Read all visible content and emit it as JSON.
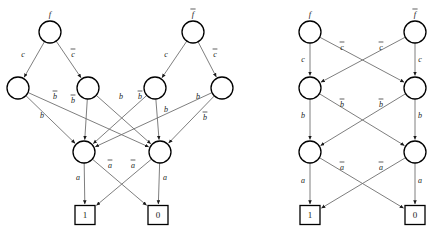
{
  "figure": {
    "title": "",
    "width": 431,
    "height": 231,
    "background_color": "#ffffff",
    "edge_color": "#6f6f6f",
    "node_stroke_color": "#000000",
    "text_color": "#1a1a1a"
  },
  "diagrams": [
    {
      "id": "left-diagram",
      "name": "unreduced-bdd",
      "nodes": [
        {
          "id": "L_f",
          "label": "f",
          "overbar": false,
          "x": 50,
          "y": 32,
          "r": 11,
          "shape": "circle"
        },
        {
          "id": "L_fb",
          "label": "f",
          "overbar": true,
          "x": 193,
          "y": 32,
          "r": 11,
          "shape": "circle"
        },
        {
          "id": "L_c1",
          "label": "",
          "overbar": false,
          "x": 18,
          "y": 88,
          "r": 11,
          "shape": "circle"
        },
        {
          "id": "L_c2",
          "label": "",
          "overbar": false,
          "x": 88,
          "y": 88,
          "r": 11,
          "shape": "circle"
        },
        {
          "id": "L_c3",
          "label": "",
          "overbar": false,
          "x": 155,
          "y": 88,
          "r": 11,
          "shape": "circle"
        },
        {
          "id": "L_c4",
          "label": "",
          "overbar": false,
          "x": 222,
          "y": 88,
          "r": 11,
          "shape": "circle"
        },
        {
          "id": "L_b1",
          "label": "",
          "overbar": false,
          "x": 84,
          "y": 152,
          "r": 11,
          "shape": "circle"
        },
        {
          "id": "L_b2",
          "label": "",
          "overbar": false,
          "x": 160,
          "y": 152,
          "r": 11,
          "shape": "circle"
        },
        {
          "id": "L_t1",
          "label": "1",
          "overbar": false,
          "x": 85,
          "y": 215,
          "w": 20,
          "h": 19,
          "shape": "box"
        },
        {
          "id": "L_t0",
          "label": "0",
          "overbar": false,
          "x": 158,
          "y": 215,
          "w": 20,
          "h": 19,
          "shape": "box"
        }
      ],
      "edges": [
        {
          "from": "L_f",
          "to": "L_c1",
          "label": "c",
          "overbar": false,
          "lx": 23,
          "ly": 57
        },
        {
          "from": "L_f",
          "to": "L_c2",
          "label": "c",
          "overbar": true,
          "lx": 73,
          "ly": 57
        },
        {
          "from": "L_fb",
          "to": "L_c3",
          "label": "c",
          "overbar": false,
          "lx": 166,
          "ly": 57
        },
        {
          "from": "L_fb",
          "to": "L_c4",
          "label": "c",
          "overbar": true,
          "lx": 215,
          "ly": 57
        },
        {
          "from": "L_c1",
          "to": "L_b2",
          "label": "b",
          "overbar": true,
          "lx": 55,
          "ly": 99
        },
        {
          "from": "L_c1",
          "to": "L_b1",
          "label": "b",
          "overbar": false,
          "lx": 42,
          "ly": 118
        },
        {
          "from": "L_c2",
          "to": "L_b1",
          "label": "b",
          "overbar": true,
          "lx": 73,
          "ly": 103
        },
        {
          "from": "L_c2",
          "to": "L_b2",
          "label": "b",
          "overbar": false,
          "lx": 121,
          "ly": 99
        },
        {
          "from": "L_c3",
          "to": "L_b1",
          "label": "b",
          "overbar": true,
          "lx": 140,
          "ly": 99
        },
        {
          "from": "L_c3",
          "to": "L_b2",
          "label": "b",
          "overbar": false,
          "lx": 166,
          "ly": 112
        },
        {
          "from": "L_c4",
          "to": "L_b2",
          "label": "b",
          "overbar": false,
          "lx": 198,
          "ly": 99
        },
        {
          "from": "L_c4",
          "to": "L_b1",
          "label": "b",
          "overbar": true,
          "lx": 205,
          "ly": 120
        },
        {
          "from": "L_b1",
          "to": "L_t1",
          "label": "a",
          "overbar": false,
          "lx": 78,
          "ly": 180
        },
        {
          "from": "L_b1",
          "to": "L_t0",
          "label": "a",
          "overbar": true,
          "lx": 110,
          "ly": 168
        },
        {
          "from": "L_b2",
          "to": "L_t1",
          "label": "a",
          "overbar": true,
          "lx": 133,
          "ly": 168
        },
        {
          "from": "L_b2",
          "to": "L_t0",
          "label": "a",
          "overbar": false,
          "lx": 165,
          "ly": 180
        }
      ]
    },
    {
      "id": "right-diagram",
      "name": "reduced-bdd",
      "nodes": [
        {
          "id": "R_f",
          "label": "f",
          "overbar": false,
          "x": 310,
          "y": 32,
          "r": 11,
          "shape": "circle"
        },
        {
          "id": "R_fb",
          "label": "f",
          "overbar": true,
          "x": 415,
          "y": 32,
          "r": 11,
          "shape": "circle"
        },
        {
          "id": "R_c1",
          "label": "",
          "overbar": false,
          "x": 310,
          "y": 88,
          "r": 11,
          "shape": "circle"
        },
        {
          "id": "R_c2",
          "label": "",
          "overbar": false,
          "x": 415,
          "y": 88,
          "r": 11,
          "shape": "circle"
        },
        {
          "id": "R_b1",
          "label": "",
          "overbar": false,
          "x": 310,
          "y": 152,
          "r": 11,
          "shape": "circle"
        },
        {
          "id": "R_b2",
          "label": "",
          "overbar": false,
          "x": 415,
          "y": 152,
          "r": 11,
          "shape": "circle"
        },
        {
          "id": "R_t1",
          "label": "1",
          "overbar": false,
          "x": 310,
          "y": 215,
          "w": 20,
          "h": 19,
          "shape": "box"
        },
        {
          "id": "R_t0",
          "label": "0",
          "overbar": false,
          "x": 415,
          "y": 215,
          "w": 20,
          "h": 19,
          "shape": "box"
        }
      ],
      "edges": [
        {
          "from": "R_f",
          "to": "R_c1",
          "label": "c",
          "overbar": false,
          "lx": 303,
          "ly": 62
        },
        {
          "from": "R_f",
          "to": "R_c2",
          "label": "c",
          "overbar": true,
          "lx": 342,
          "ly": 50
        },
        {
          "from": "R_fb",
          "to": "R_c2",
          "label": "c",
          "overbar": false,
          "lx": 420,
          "ly": 62
        },
        {
          "from": "R_fb",
          "to": "R_c1",
          "label": "c",
          "overbar": true,
          "lx": 381,
          "ly": 50
        },
        {
          "from": "R_c1",
          "to": "R_b1",
          "label": "b",
          "overbar": false,
          "lx": 303,
          "ly": 118
        },
        {
          "from": "R_c1",
          "to": "R_b2",
          "label": "b",
          "overbar": true,
          "lx": 342,
          "ly": 107
        },
        {
          "from": "R_c2",
          "to": "R_b2",
          "label": "b",
          "overbar": false,
          "lx": 420,
          "ly": 118
        },
        {
          "from": "R_c2",
          "to": "R_b1",
          "label": "b",
          "overbar": true,
          "lx": 381,
          "ly": 107
        },
        {
          "from": "R_b1",
          "to": "R_t1",
          "label": "a",
          "overbar": false,
          "lx": 303,
          "ly": 183
        },
        {
          "from": "R_b1",
          "to": "R_t0",
          "label": "a",
          "overbar": true,
          "lx": 342,
          "ly": 170
        },
        {
          "from": "R_c2",
          "to": "R_b1_alt",
          "label": "",
          "overbar": false,
          "lx": 0,
          "ly": 0
        },
        {
          "from": "R_b2",
          "to": "R_t1",
          "label": "a",
          "overbar": true,
          "lx": 381,
          "ly": 170
        },
        {
          "from": "R_b2",
          "to": "R_t0",
          "label": "a",
          "overbar": false,
          "lx": 420,
          "ly": 183
        }
      ]
    }
  ]
}
